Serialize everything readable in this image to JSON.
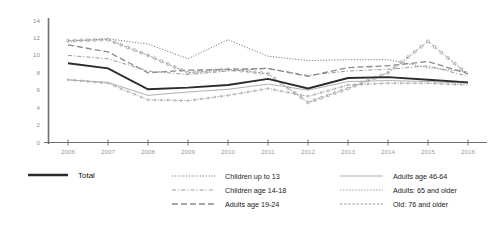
{
  "chart_data": {
    "type": "line",
    "title": "",
    "xlabel": "",
    "ylabel": "",
    "categories": [
      "2006",
      "2007",
      "2008",
      "2009",
      "2010",
      "2011",
      "2012",
      "2013",
      "2014",
      "2015",
      "2016"
    ],
    "x": [
      2006,
      2007,
      2008,
      2009,
      2010,
      2011,
      2012,
      2013,
      2014,
      2015,
      2016
    ],
    "ylim": [
      0,
      14
    ],
    "yticks": [
      0,
      2,
      4,
      6,
      8,
      10,
      12,
      14
    ],
    "ytick_labels": [
      "0",
      "2",
      "4",
      "6",
      "8",
      "10",
      "12",
      "14"
    ],
    "grid": false,
    "legend_position": "bottom",
    "series": [
      {
        "name": "Total",
        "style": "solid-thick",
        "color": "#2b2b2b",
        "values": [
          9.1,
          8.5,
          6.1,
          6.3,
          6.6,
          7.3,
          6.2,
          7.4,
          7.5,
          7.2,
          6.9
        ]
      },
      {
        "name": "Children up to 13",
        "style": "dotted-fine",
        "color": "#7d7d7d",
        "values": [
          11.6,
          11.9,
          11.3,
          9.6,
          11.8,
          9.9,
          9.4,
          9.5,
          9.5,
          8.6,
          8.1
        ]
      },
      {
        "name": "Children age 14-18",
        "style": "dash-dot",
        "color": "#9a9a9a",
        "values": [
          10.0,
          9.6,
          8.2,
          7.8,
          8.2,
          8.5,
          7.7,
          8.2,
          8.4,
          8.8,
          7.6
        ]
      },
      {
        "name": "Adults age 19-24",
        "style": "dash-long",
        "color": "#8a8a8a",
        "values": [
          11.2,
          10.4,
          8.0,
          8.3,
          8.4,
          8.5,
          7.6,
          8.6,
          8.8,
          9.3,
          7.9
        ]
      },
      {
        "name": "Adults age 46-64",
        "style": "solid-thin",
        "color": "#b0b0b0",
        "values": [
          7.2,
          6.9,
          5.4,
          5.8,
          6.1,
          6.7,
          6.0,
          7.0,
          7.1,
          7.0,
          6.8
        ]
      },
      {
        "name": "Adults: 65 and older",
        "style": "dotted-square",
        "color": "#a8a8a8",
        "values": [
          7.2,
          6.8,
          4.9,
          4.8,
          5.4,
          6.2,
          5.3,
          6.6,
          6.8,
          6.8,
          6.6
        ]
      },
      {
        "name": "Old: 76 and older",
        "style": "circle-chain",
        "color": "#9d9d9d",
        "values": [
          11.7,
          11.8,
          10.0,
          8.0,
          8.4,
          7.9,
          4.6,
          6.2,
          8.0,
          11.6,
          7.8
        ]
      }
    ]
  },
  "legend": {
    "total": {
      "label": "Total"
    },
    "column_left": [
      {
        "label": "Children up to 13"
      },
      {
        "label": "Children age 14-18"
      },
      {
        "label": "Adults age 19-24"
      }
    ],
    "column_right": [
      {
        "label": "Adults age 46-64"
      },
      {
        "label": "Adults: 65 and older"
      },
      {
        "label": "Old: 76 and older"
      }
    ]
  },
  "axes": {
    "y_tick_labels": [
      "14",
      "12",
      "10",
      "8",
      "6",
      "4",
      "2",
      "0"
    ],
    "x_tick_labels": [
      "2006",
      "2007",
      "2008",
      "2009",
      "2010",
      "2011",
      "2012",
      "2013",
      "2014",
      "2015",
      "2016"
    ]
  },
  "colors": {
    "axis": "#7a7a7a",
    "total_line": "#2b2b2b",
    "background": "#ffffff"
  }
}
